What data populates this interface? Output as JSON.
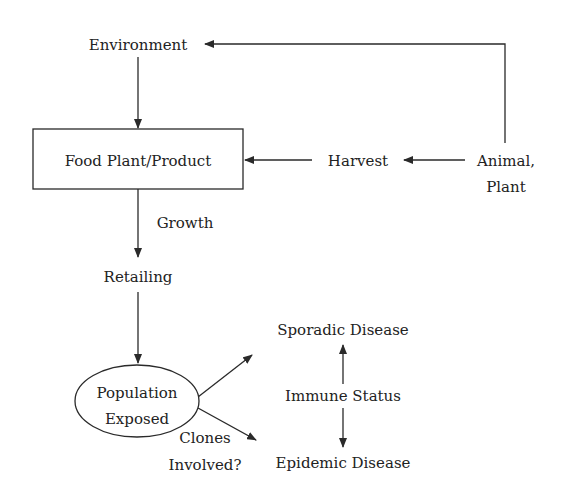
{
  "diagram": {
    "type": "flowchart",
    "nodes": {
      "environment": "Environment",
      "food_plant": "Food Plant/Product",
      "harvest": "Harvest",
      "animal_plant_line1": "Animal,",
      "animal_plant_line2": "Plant",
      "growth": "Growth",
      "retailing": "Retailing",
      "population_line1": "Population",
      "population_line2": "Exposed",
      "clones_line1": "Clones",
      "clones_line2": "Involved?",
      "sporadic": "Sporadic Disease",
      "immune": "Immune Status",
      "epidemic": "Epidemic Disease"
    },
    "edges": [
      {
        "from": "Animal, Plant",
        "to": "Environment"
      },
      {
        "from": "Environment",
        "to": "Food Plant/Product"
      },
      {
        "from": "Animal, Plant",
        "to": "Harvest"
      },
      {
        "from": "Harvest",
        "to": "Food Plant/Product"
      },
      {
        "from": "Food Plant/Product",
        "to": "Retailing",
        "label": "Growth"
      },
      {
        "from": "Retailing",
        "to": "Population Exposed"
      },
      {
        "from": "Population Exposed",
        "to": "Sporadic Disease"
      },
      {
        "from": "Population Exposed",
        "to": "Epidemic Disease",
        "label": "Clones Involved?"
      },
      {
        "from": "Immune Status",
        "to": "Sporadic Disease"
      },
      {
        "from": "Immune Status",
        "to": "Epidemic Disease"
      }
    ],
    "colors": {
      "stroke": "#2a2a2a",
      "text": "#222222",
      "background": "#ffffff"
    }
  }
}
